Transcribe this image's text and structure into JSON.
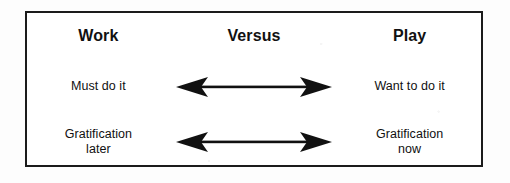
{
  "diagram": {
    "title": "Work Versus Play",
    "frame": {
      "border_color": "#1b1b1b",
      "background_color": "#ffffff"
    },
    "columns": [
      {
        "id": "work",
        "heading": "Work"
      },
      {
        "id": "versus",
        "heading": "Versus"
      },
      {
        "id": "play",
        "heading": "Play"
      }
    ],
    "rows": [
      {
        "id": "row-1",
        "left": {
          "line1": "Must do it",
          "line2": ""
        },
        "center": {
          "icon": "double-headed-arrow-icon"
        },
        "right": {
          "line1": "Want to do it",
          "line2": ""
        }
      },
      {
        "id": "row-2",
        "left": {
          "line1": "Gratification",
          "line2": "later"
        },
        "center": {
          "icon": "double-headed-arrow-icon"
        },
        "right": {
          "line1": "Gratification",
          "line2": "now"
        }
      }
    ],
    "arrow": {
      "color": "#111111",
      "direction": "bidirectional",
      "shaft_length_px": 152
    }
  }
}
